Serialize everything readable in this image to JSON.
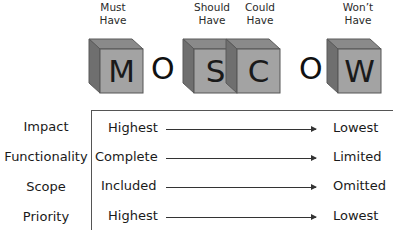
{
  "diagram": {
    "title_letters": [
      "M",
      "O",
      "S",
      "C",
      "O",
      "W"
    ],
    "categories": [
      {
        "letter": "M",
        "caption_line1": "Must",
        "caption_line2": "Have"
      },
      {
        "letter": "S",
        "caption_line1": "Should",
        "caption_line2": "Have"
      },
      {
        "letter": "C",
        "caption_line1": "Could",
        "caption_line2": "Have"
      },
      {
        "letter": "W",
        "caption_line1": "Won’t",
        "caption_line2": "Have"
      }
    ],
    "filler_letters": [
      "O",
      "O"
    ],
    "rows": [
      {
        "label": "Impact",
        "from": "Highest",
        "to": "Lowest"
      },
      {
        "label": "Functionality",
        "from": "Complete",
        "to": "Limited"
      },
      {
        "label": "Scope",
        "from": "Included",
        "to": "Omitted"
      },
      {
        "label": "Priority",
        "from": "Highest",
        "to": "Lowest"
      }
    ],
    "colors": {
      "cube_front": "#a3a3a3",
      "cube_back": "#7d7d7d",
      "line": "#555555"
    }
  }
}
